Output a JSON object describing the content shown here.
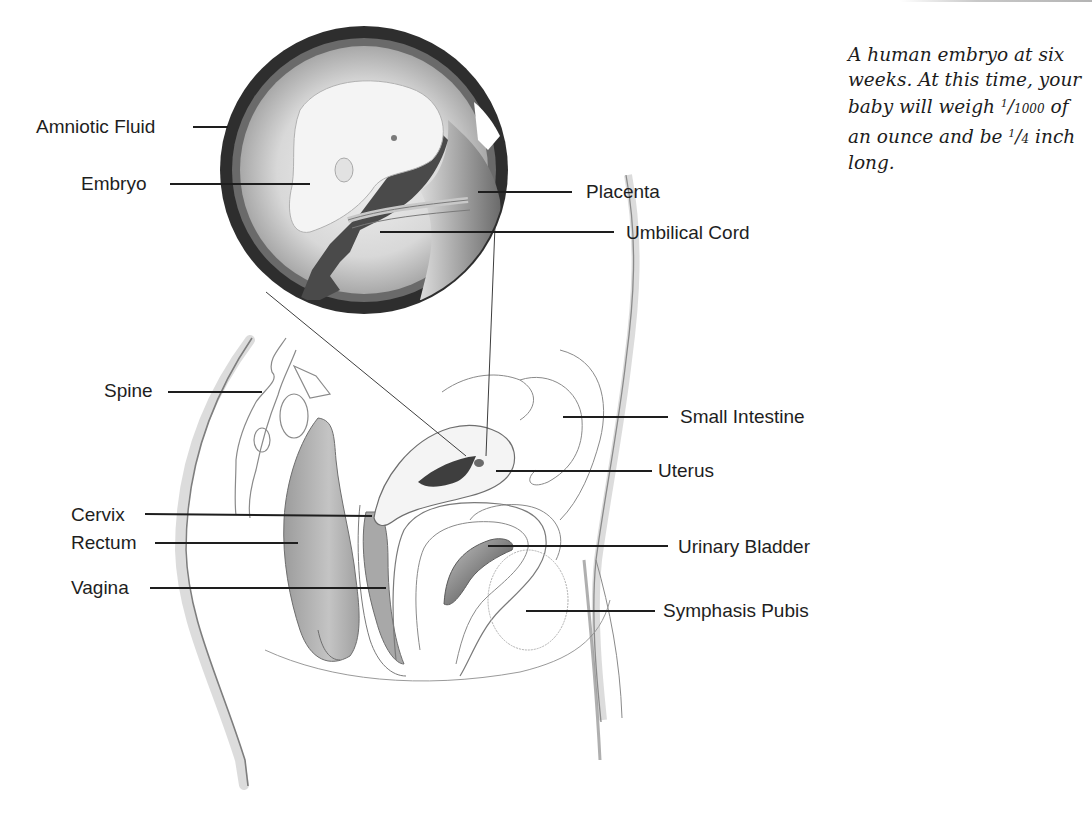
{
  "figure": {
    "caption": {
      "line1": "A human embryo at six",
      "line2": "weeks. At this time, your",
      "line3_pre": "baby will weigh ",
      "weight_num": "1",
      "weight_den": "1000",
      "line3_post": " of",
      "line4_pre": "an ounce and be ",
      "length_num": "1",
      "length_den": "4",
      "line4_post": " inch",
      "line5": "long."
    },
    "labels": {
      "amniotic_fluid": "Amniotic Fluid",
      "embryo": "Embryo",
      "placenta": "Placenta",
      "umbilical_cord": "Umbilical Cord",
      "spine": "Spine",
      "small_intestine": "Small Intestine",
      "uterus": "Uterus",
      "cervix": "Cervix",
      "rectum": "Rectum",
      "urinary_bladder": "Urinary Bladder",
      "vagina": "Vagina",
      "symphasis_pubis": "Symphasis Pubis"
    },
    "colors": {
      "ink": "#1e1e1e",
      "shade_dark": "#4a4a4a",
      "shade_mid": "#9a9a9a",
      "shade_light": "#d6d6d6",
      "outline": "#8a8a8a"
    }
  }
}
